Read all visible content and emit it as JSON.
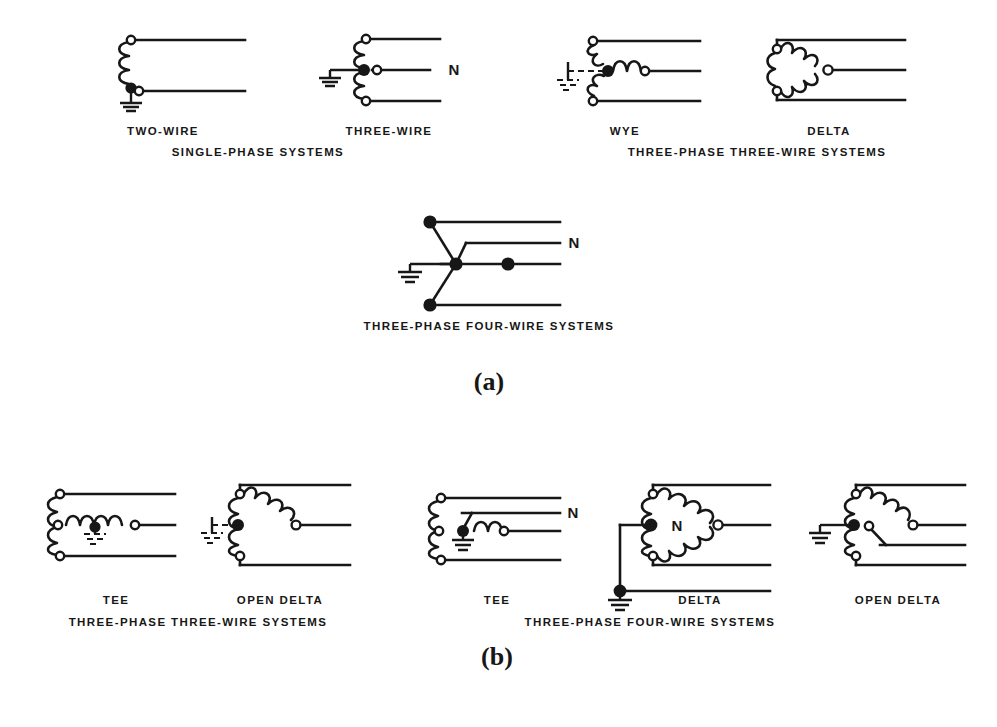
{
  "figure": {
    "background_color": "#ffffff",
    "line_color": "#171717",
    "width": 997,
    "height": 727
  },
  "panel_a": {
    "caption": "(a)",
    "group_labels": {
      "single_phase": "SINGLE-PHASE SYSTEMS",
      "three_phase_three_wire": "THREE-PHASE THREE-WIRE SYSTEMS",
      "three_phase_four_wire": "THREE-PHASE FOUR-WIRE SYSTEMS"
    },
    "diagrams": [
      {
        "id": "two-wire",
        "label": "TWO-WIRE",
        "group": "SINGLE-PHASE SYSTEMS",
        "wires": 2,
        "neutral_label": ""
      },
      {
        "id": "three-wire",
        "label": "THREE-WIRE",
        "group": "SINGLE-PHASE SYSTEMS",
        "wires": 3,
        "neutral_label": "N"
      },
      {
        "id": "wye",
        "label": "WYE",
        "group": "THREE-PHASE THREE-WIRE SYSTEMS",
        "wires": 3,
        "neutral_label": ""
      },
      {
        "id": "delta",
        "label": "DELTA",
        "group": "THREE-PHASE THREE-WIRE SYSTEMS",
        "wires": 3,
        "neutral_label": ""
      },
      {
        "id": "four-wire-wye",
        "label": "",
        "group": "THREE-PHASE FOUR-WIRE SYSTEMS",
        "wires": 4,
        "neutral_label": "N"
      }
    ]
  },
  "panel_b": {
    "caption": "(b)",
    "group_labels": {
      "three_phase_three_wire": "THREE-PHASE THREE-WIRE SYSTEMS",
      "three_phase_four_wire": "THREE-PHASE FOUR-WIRE SYSTEMS"
    },
    "diagrams": [
      {
        "id": "tee-3w",
        "label": "TEE",
        "group": "THREE-PHASE THREE-WIRE SYSTEMS",
        "wires": 3,
        "neutral_label": ""
      },
      {
        "id": "open-delta-3w",
        "label": "OPEN DELTA",
        "group": "THREE-PHASE THREE-WIRE SYSTEMS",
        "wires": 3,
        "neutral_label": ""
      },
      {
        "id": "tee-4w",
        "label": "TEE",
        "group": "THREE-PHASE FOUR-WIRE SYSTEMS",
        "wires": 4,
        "neutral_label": "N"
      },
      {
        "id": "delta-4w",
        "label": "DELTA",
        "group": "THREE-PHASE FOUR-WIRE SYSTEMS",
        "wires": 4,
        "neutral_label": "N"
      },
      {
        "id": "open-delta-4w",
        "label": "OPEN DELTA",
        "group": "THREE-PHASE FOUR-WIRE SYSTEMS",
        "wires": 4,
        "neutral_label": ""
      }
    ]
  }
}
